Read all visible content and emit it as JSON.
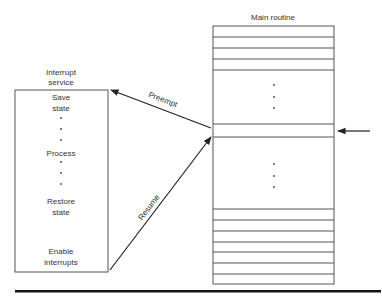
{
  "main_routine": {
    "title": "Main routine",
    "box": {
      "x": 213,
      "y": 26,
      "w": 121,
      "h": 258
    },
    "top_lines": [
      37,
      48,
      59,
      70
    ],
    "middle_lines": [
      124,
      137
    ],
    "bottom_lines": [
      209,
      220,
      231,
      242,
      252,
      263,
      274
    ],
    "upper_dots": [
      85,
      97,
      108
    ],
    "lower_dots": [
      164,
      176,
      187
    ],
    "dots_x": 274
  },
  "interrupt_service": {
    "title_line1": "Interrupt",
    "title_line2": "service",
    "box": {
      "x": 15,
      "y": 90,
      "w": 93,
      "h": 182
    },
    "steps": {
      "save_line1": "Save",
      "save_line2": "state",
      "process": "Process",
      "restore_line1": "Restore",
      "restore_line2": "state",
      "enable_line1": "Enable",
      "enable_line2": "interrupts"
    },
    "dots_after_save": [
      118,
      129,
      140
    ],
    "dots_after_process": [
      162,
      173,
      184
    ]
  },
  "arrows": {
    "preempt": {
      "label": "Preempt",
      "from": [
        211,
        128
      ],
      "to": [
        111,
        90
      ]
    },
    "resume": {
      "label": "Resume",
      "from": [
        110,
        270
      ],
      "to": [
        211,
        137
      ]
    },
    "interrupt_pointer": {
      "from": [
        370,
        131
      ],
      "to": [
        338,
        131
      ]
    }
  },
  "colors": {
    "line": "#555555",
    "arrow": "#222222",
    "rule": "#111111"
  }
}
